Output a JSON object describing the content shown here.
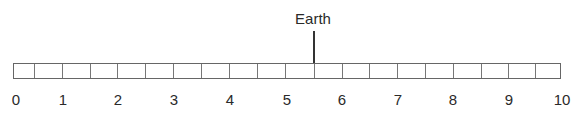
{
  "diagram": {
    "type": "number-line",
    "range": [
      0,
      10
    ],
    "tick_labels": [
      "0",
      "1",
      "2",
      "3",
      "4",
      "5",
      "6",
      "7",
      "8",
      "9",
      "10"
    ],
    "tick_positions_px": [
      16,
      63,
      118,
      174,
      230,
      287,
      342,
      398,
      453,
      509,
      562
    ],
    "cell_dividers_px": [
      20,
      48,
      76,
      103,
      131,
      159,
      187,
      215,
      243,
      271,
      300,
      328,
      355,
      383,
      411,
      439,
      467,
      494,
      521
    ],
    "marker": {
      "label": "Earth",
      "value": 5.5,
      "x_px": 313
    },
    "colors": {
      "line": "#666666",
      "text": "#2a2a2a",
      "background": "#ffffff"
    }
  }
}
